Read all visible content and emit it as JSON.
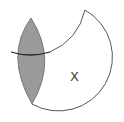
{
  "diagram": {
    "type": "set-region-diagram",
    "labels": {
      "region_x": "X"
    },
    "colors": {
      "shaded_fill": "#9a9a9a",
      "stroke": "#555555",
      "dark_stroke": "#222222",
      "background": "#ffffff"
    }
  }
}
